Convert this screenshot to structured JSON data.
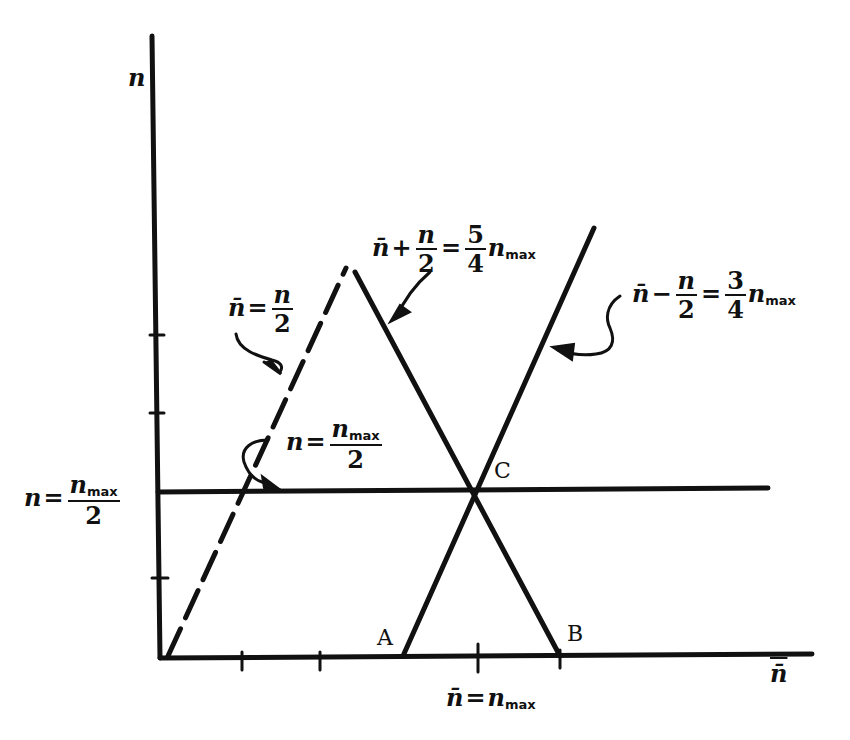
{
  "diagram": {
    "title": "",
    "axes": {
      "y_label": "n",
      "x_label": "n̄",
      "y_ticks": 4,
      "x_ticks": 3
    },
    "lines": [
      {
        "id": "dashed",
        "equation_lhs": "n̄",
        "equation_op": "=",
        "equation_num": "n",
        "equation_den": "2",
        "style": "dashed"
      },
      {
        "id": "descending",
        "equation_lhs": "n̄",
        "equation_op1": "+",
        "equation_num": "n",
        "equation_den": "2",
        "equation_op2": "=",
        "coef_num": "5",
        "coef_den": "4",
        "rhs": "n",
        "rhs_sub": "max",
        "style": "solid"
      },
      {
        "id": "ascending",
        "equation_lhs": "n̄",
        "equation_op1": "−",
        "equation_num": "n",
        "equation_den": "2",
        "equation_op2": "=",
        "coef_num": "3",
        "coef_den": "4",
        "rhs": "n",
        "rhs_sub": "max",
        "style": "solid"
      },
      {
        "id": "horizontal",
        "equation_lhs": "n",
        "equation_op": "=",
        "equation_num": "n",
        "equation_num_sub": "max",
        "equation_den": "2",
        "style": "solid"
      }
    ],
    "left_label": {
      "lhs": "n",
      "op": "=",
      "num": "n",
      "num_sub": "max",
      "den": "2"
    },
    "bottom_label": {
      "lhs": "n̄",
      "op": "=",
      "rhs": "n",
      "rhs_sub": "max"
    },
    "points": [
      {
        "name": "A",
        "label": "A"
      },
      {
        "name": "B",
        "label": "B"
      },
      {
        "name": "C",
        "label": "C"
      }
    ]
  }
}
